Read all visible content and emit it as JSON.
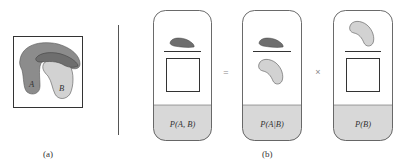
{
  "colors": {
    "region_a": "#8c8c8c",
    "region_b": "#d2d2d2",
    "overlap": "#6e6e6e",
    "card_fill": "#d8d8d8",
    "stroke": "#333333"
  },
  "panel_a": {
    "caption": "(a)",
    "label_a": "A",
    "label_b": "B"
  },
  "panel_b": {
    "caption": "(b)",
    "equals": "=",
    "times": "×",
    "cards": [
      {
        "label": "P(A, B)",
        "numerator": "overlap",
        "denominator": "box"
      },
      {
        "label": "P(A|B)",
        "numerator": "overlap",
        "denominator": "region-b"
      },
      {
        "label": "P(B)",
        "numerator": "region-b",
        "denominator": "box"
      }
    ]
  }
}
